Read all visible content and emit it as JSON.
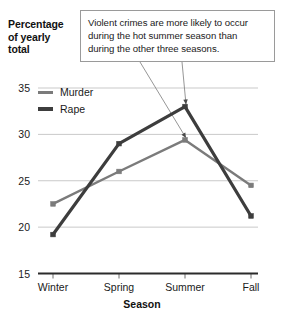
{
  "chart_data": {
    "type": "line",
    "title": "",
    "xlabel": "Season",
    "ylabel": "Percentage of yearly total",
    "categories": [
      "Winter",
      "Spring",
      "Summer",
      "Fall"
    ],
    "series": [
      {
        "name": "Murder",
        "values": [
          22.5,
          26.0,
          29.4,
          24.5
        ],
        "color": "#7b7b7b"
      },
      {
        "name": "Rape",
        "values": [
          19.2,
          29.0,
          33.0,
          21.2
        ],
        "color": "#3d3d3d"
      }
    ],
    "ylim": [
      15,
      35
    ],
    "yticks": [
      15,
      20,
      25,
      30,
      35
    ],
    "ytick_labels": [
      "15",
      "20",
      "25",
      "30",
      "35"
    ],
    "grid": true,
    "legend_position": "inside-top-left",
    "annotations": [
      {
        "text": "Violent crimes are more likely to occur during the hot summer season than during the other three seasons.",
        "lines": [
          "Violent crimes are more likely to occur",
          "during the hot summer season than",
          "during the other three seasons."
        ],
        "points_to": [
          "Murder.Summer",
          "Rape.Summer"
        ]
      }
    ]
  },
  "axis": {
    "y_title_lines": [
      "Percentage",
      "of yearly",
      "total"
    ],
    "x_title": "Season"
  },
  "colors": {
    "murder": "#7b7b7b",
    "rape": "#3d3d3d",
    "gridline": "#c9c9c9",
    "axis": "#2b2b2b",
    "callout_border": "#9a9a9a",
    "leader": "#8a8a8a",
    "background": "#ffffff"
  }
}
